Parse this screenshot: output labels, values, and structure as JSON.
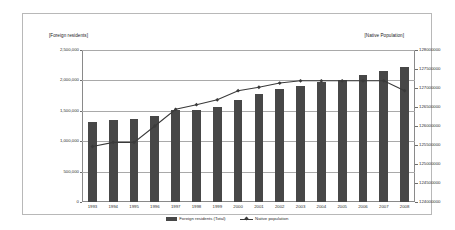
{
  "chart_data": {
    "type": "bar",
    "title": "",
    "subtitle": "",
    "xlabel": "",
    "ylabel": "[Foreign residents]",
    "y2label": "[Native Population]",
    "grid": true,
    "legend_position": "bottom",
    "categories": [
      "1993",
      "1994",
      "1995",
      "1996",
      "1997",
      "1998",
      "1999",
      "2000",
      "2001",
      "2002",
      "2003",
      "2004",
      "2005",
      "2006",
      "2007",
      "2008"
    ],
    "left_axis": {
      "title": "[Foreign residents]",
      "min": 0,
      "max": 2500000,
      "step": 500000,
      "ticks": [
        "0",
        "500,000",
        "1,000,000",
        "1,500,000",
        "2,000,000",
        "2,500,000"
      ],
      "tick_values": [
        0,
        500000,
        1000000,
        1500000,
        2000000,
        2500000
      ]
    },
    "right_axis": {
      "title": "[Native Population]",
      "min": 124000000,
      "max": 128000000,
      "step": 500000,
      "ticks": [
        "124000000",
        "124500000",
        "125000000",
        "125500000",
        "126000000",
        "126500000",
        "127000000",
        "127500000",
        "128000000"
      ],
      "tick_values": [
        124000000,
        124500000,
        125000000,
        125500000,
        126000000,
        126500000,
        127000000,
        127500000,
        128000000
      ]
    },
    "series": [
      {
        "name": "Foreign residents (Total)",
        "type": "bar",
        "axis": "left",
        "color": "#474747",
        "values": [
          1320000,
          1354000,
          1362000,
          1415000,
          1513000,
          1512000,
          1556000,
          1686000,
          1779000,
          1852000,
          1915000,
          1974000,
          2012000,
          2085000,
          2153000,
          2217000
        ]
      },
      {
        "name": "Native population",
        "type": "line",
        "axis": "right",
        "color": "#3a3a3a",
        "values": [
          125460000,
          125570000,
          125570000,
          126000000,
          126440000,
          126560000,
          126690000,
          126930000,
          127020000,
          127130000,
          127190000,
          127190000,
          127190000,
          127190000,
          127190000,
          126930000
        ]
      }
    ],
    "legend": [
      {
        "label": "Foreign residents (Total)",
        "marker": "bar-swatch"
      },
      {
        "label": "Native population",
        "marker": "line-marker-swatch"
      }
    ]
  }
}
